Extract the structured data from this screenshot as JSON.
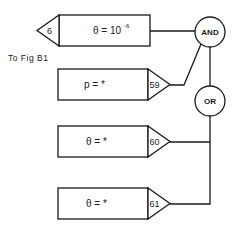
{
  "diagram": {
    "type": "fault-tree logic",
    "note": "To Fig B1",
    "blocks": [
      {
        "id": "6",
        "expression": "θ = 10",
        "exponent": "-6",
        "connector_side": "left",
        "connects_to": "AND"
      },
      {
        "id": "59",
        "expression": "p = *",
        "exponent": "",
        "connector_side": "right",
        "connects_to": "AND"
      },
      {
        "id": "60",
        "expression": "θ = *",
        "exponent": "",
        "connector_side": "right",
        "connects_to": "OR"
      },
      {
        "id": "61",
        "expression": "θ = *",
        "exponent": "",
        "connector_side": "right",
        "connects_to": "OR"
      }
    ],
    "gates": [
      {
        "label": "AND",
        "inputs": [
          "6",
          "59",
          "OR"
        ]
      },
      {
        "label": "OR",
        "inputs": [
          "60",
          "61"
        ]
      }
    ],
    "colors": {
      "line": "#1a1a1a",
      "background": "#ffffff"
    }
  }
}
